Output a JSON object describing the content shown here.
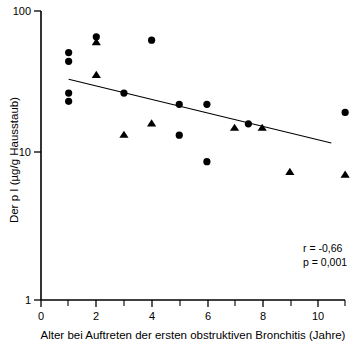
{
  "chart_data": {
    "type": "scatter",
    "title": "",
    "xlabel": "Alter bei Auftreten der ersten obstruktiven Bronchitis (Jahre)",
    "ylabel": "Der p I (µg/g Hausstaub)",
    "yscale": "log",
    "ylim": [
      1,
      100
    ],
    "xlim": [
      -0.05,
      11.05
    ],
    "ytick_labels": [
      "100",
      "10",
      "1"
    ],
    "ytick_values": [
      100,
      10,
      1
    ],
    "xtick_labels": [
      "0",
      "2",
      "4",
      "6",
      "8",
      "10"
    ],
    "xtick_values": [
      0,
      2,
      4,
      6,
      8,
      10
    ],
    "xtick_minor_values": [
      1,
      3,
      5,
      7,
      9,
      11
    ],
    "grid": false,
    "legend": null,
    "series": [
      {
        "name": "circle-points",
        "marker": "circle",
        "points": [
          {
            "x": 1.0,
            "y": 47.0
          },
          {
            "x": 1.0,
            "y": 41.0
          },
          {
            "x": 1.0,
            "y": 25.0
          },
          {
            "x": 1.0,
            "y": 22.0
          },
          {
            "x": 2.0,
            "y": 60.0
          },
          {
            "x": 3.0,
            "y": 25.0
          },
          {
            "x": 4.0,
            "y": 57.0
          },
          {
            "x": 5.0,
            "y": 21.0
          },
          {
            "x": 5.0,
            "y": 13.0
          },
          {
            "x": 6.0,
            "y": 21.0
          },
          {
            "x": 6.0,
            "y": 8.6
          },
          {
            "x": 7.5,
            "y": 15.5
          },
          {
            "x": 11.0,
            "y": 18.5
          }
        ]
      },
      {
        "name": "triangle-points",
        "marker": "triangle",
        "points": [
          {
            "x": 2.0,
            "y": 55.0
          },
          {
            "x": 2.0,
            "y": 33.0
          },
          {
            "x": 3.0,
            "y": 13.0
          },
          {
            "x": 4.0,
            "y": 15.5
          },
          {
            "x": 7.0,
            "y": 14.5
          },
          {
            "x": 8.0,
            "y": 14.5
          },
          {
            "x": 9.0,
            "y": 7.3
          },
          {
            "x": 11.0,
            "y": 7.0
          }
        ]
      }
    ],
    "fit_line": {
      "name": "regression-line",
      "x_start": 1.0,
      "y_start": 31.0,
      "x_end": 10.5,
      "y_end": 11.5
    },
    "annotations": {
      "r_label": "r  = -0,66",
      "p_label": "p = 0,001"
    }
  },
  "colors": {
    "foreground": "#000000",
    "background": "#ffffff"
  }
}
